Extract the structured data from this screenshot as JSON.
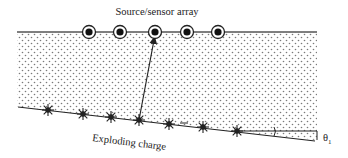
{
  "title_label": "Source/sensor array",
  "charge_label": "Exploding charge",
  "angle_label": "θ",
  "angle_subscript": "1",
  "colors": {
    "ink": "#222222",
    "dots": "#7a7a7a",
    "background": "#ffffff"
  },
  "surface": {
    "y": 32,
    "x_start": 17,
    "x_end": 317
  },
  "sensors": [
    {
      "x": 89,
      "y": 32
    },
    {
      "x": 120,
      "y": 32
    },
    {
      "x": 155,
      "y": 32
    },
    {
      "x": 187,
      "y": 32
    },
    {
      "x": 218,
      "y": 32
    }
  ],
  "reflector": {
    "x1": 18,
    "y1": 107,
    "x2": 315,
    "y2": 140
  },
  "charges": [
    {
      "x": 48,
      "y": 110
    },
    {
      "x": 83,
      "y": 114
    },
    {
      "x": 111,
      "y": 117
    },
    {
      "x": 139,
      "y": 120
    },
    {
      "x": 169,
      "y": 124
    },
    {
      "x": 203,
      "y": 127
    },
    {
      "x": 237,
      "y": 131
    }
  ],
  "ray": {
    "from_charge_index": 3,
    "to_sensor_index": 2
  }
}
